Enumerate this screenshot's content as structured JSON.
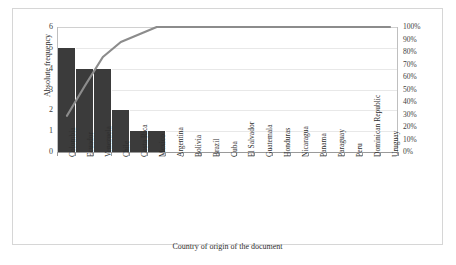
{
  "chart_data": {
    "type": "bar",
    "title": "",
    "subtitle": "",
    "xlabel": "Country of origin of the document",
    "ylabel": "Absolute frequency",
    "y2label": "Cumulative relative frequency",
    "ylim": [
      0,
      6
    ],
    "y2lim": [
      0,
      100
    ],
    "grid": true,
    "legend": "none",
    "categories": [
      "Colombia",
      "Ecuador",
      "Venezuela",
      "Chile",
      "Costa Rica",
      "Mexico",
      "Argentina",
      "Bolivia",
      "Brazil",
      "Cuba",
      "El Salvador",
      "Guatemala",
      "Honduras",
      "Nicaragua",
      "Panama",
      "Paraguay",
      "Peru",
      "Dominican Republic",
      "Uruguay"
    ],
    "series": [
      {
        "name": "Absolute frequency",
        "type": "bar",
        "axis": "left",
        "color": "#3b3b3b",
        "values": [
          5,
          4,
          4,
          2,
          1,
          1,
          0,
          0,
          0,
          0,
          0,
          0,
          0,
          0,
          0,
          0,
          0,
          0,
          0
        ]
      },
      {
        "name": "Cumulative relative frequency",
        "type": "line",
        "axis": "right",
        "color": "#8c8c8c",
        "values": [
          29,
          53,
          76,
          88,
          94,
          100,
          100,
          100,
          100,
          100,
          100,
          100,
          100,
          100,
          100,
          100,
          100,
          100,
          100
        ]
      }
    ],
    "yticks": [
      "0",
      "1",
      "2",
      "3",
      "4",
      "5",
      "6"
    ],
    "y2ticks": [
      "0%",
      "10%",
      "20%",
      "30%",
      "40%",
      "50%",
      "60%",
      "70%",
      "80%",
      "90%",
      "100%"
    ]
  },
  "colors": {
    "bar": "#3b3b3b",
    "line": "#8c8c8c",
    "grid": "#e8e8e8",
    "axis": "#9a9a9a",
    "frame": "#d6d6d6",
    "text": "#2e2e2e",
    "background": "#ffffff"
  }
}
